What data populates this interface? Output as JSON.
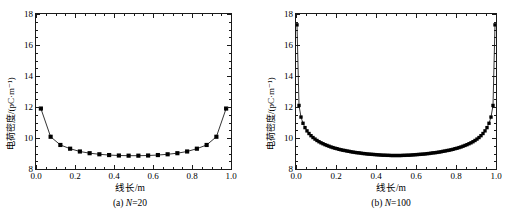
{
  "figure": {
    "panels": [
      {
        "id": "a",
        "caption_prefix": "(a) ",
        "caption_var": "N",
        "caption_suffix": "=20"
      },
      {
        "id": "b",
        "caption_prefix": "(b) ",
        "caption_var": "N",
        "caption_suffix": "=100"
      }
    ]
  },
  "chart_data": [
    {
      "type": "line",
      "title": "",
      "panel_label": "(a) N=20",
      "xlabel": "线长/m",
      "ylabel": "电荷密度/(pC·m⁻¹)",
      "xlim": [
        0.0,
        1.0
      ],
      "ylim": [
        8,
        18
      ],
      "xticks": [
        0.0,
        0.2,
        0.4,
        0.6,
        0.8,
        1.0
      ],
      "xticklabels": [
        "0.0",
        "0.2",
        "0.4",
        "0.6",
        "0.8",
        "1.0"
      ],
      "xminor_step": 0.05,
      "yticks": [
        8,
        10,
        12,
        14,
        16,
        18
      ],
      "yticklabels": [
        "8",
        "10",
        "12",
        "14",
        "16",
        "18"
      ],
      "yminor_step": 0.5,
      "grid": false,
      "legend": null,
      "marker": "square",
      "marker_color": "#000000",
      "line_color": "#000000",
      "series": [
        {
          "name": "N=20",
          "x": [
            0.025,
            0.075,
            0.125,
            0.175,
            0.225,
            0.275,
            0.325,
            0.375,
            0.425,
            0.475,
            0.525,
            0.575,
            0.625,
            0.675,
            0.725,
            0.775,
            0.825,
            0.875,
            0.925,
            0.975
          ],
          "y": [
            11.9,
            10.08,
            9.55,
            9.31,
            9.13,
            9.02,
            8.95,
            8.9,
            8.87,
            8.86,
            8.86,
            8.87,
            8.9,
            8.95,
            9.02,
            9.13,
            9.31,
            9.55,
            10.08,
            11.9
          ]
        }
      ]
    },
    {
      "type": "line",
      "title": "",
      "panel_label": "(b) N=100",
      "xlabel": "线长/m",
      "ylabel": "电荷密度/(pC·m⁻¹)",
      "xlim": [
        0.0,
        1.0
      ],
      "ylim": [
        8,
        18
      ],
      "xticks": [
        0.0,
        0.2,
        0.4,
        0.6,
        0.8,
        1.0
      ],
      "xticklabels": [
        "0.0",
        "0.2",
        "0.4",
        "0.6",
        "0.8",
        "1.0"
      ],
      "xminor_step": 0.05,
      "yticks": [
        8,
        10,
        12,
        14,
        16,
        18
      ],
      "yticklabels": [
        "8",
        "10",
        "12",
        "14",
        "16",
        "18"
      ],
      "yminor_step": 0.5,
      "grid": false,
      "legend": null,
      "marker": "square",
      "marker_color": "#000000",
      "line_color": "#000000",
      "series": [
        {
          "name": "N=100",
          "x": [
            0.005,
            0.015,
            0.025,
            0.035,
            0.045,
            0.055,
            0.065,
            0.075,
            0.085,
            0.095,
            0.105,
            0.115,
            0.125,
            0.135,
            0.145,
            0.155,
            0.165,
            0.175,
            0.185,
            0.195,
            0.205,
            0.215,
            0.225,
            0.235,
            0.245,
            0.255,
            0.265,
            0.275,
            0.285,
            0.295,
            0.305,
            0.315,
            0.325,
            0.335,
            0.345,
            0.355,
            0.365,
            0.375,
            0.385,
            0.395,
            0.405,
            0.415,
            0.425,
            0.435,
            0.445,
            0.455,
            0.465,
            0.475,
            0.485,
            0.495,
            0.505,
            0.515,
            0.525,
            0.535,
            0.545,
            0.555,
            0.565,
            0.575,
            0.585,
            0.595,
            0.605,
            0.615,
            0.625,
            0.635,
            0.645,
            0.655,
            0.665,
            0.675,
            0.685,
            0.695,
            0.705,
            0.715,
            0.725,
            0.735,
            0.745,
            0.755,
            0.765,
            0.775,
            0.785,
            0.795,
            0.805,
            0.815,
            0.825,
            0.835,
            0.845,
            0.855,
            0.865,
            0.875,
            0.885,
            0.895,
            0.905,
            0.915,
            0.925,
            0.935,
            0.945,
            0.955,
            0.965,
            0.975,
            0.985,
            0.995
          ],
          "y": [
            17.3,
            12.1,
            11.35,
            10.95,
            10.67,
            10.46,
            10.29,
            10.15,
            10.03,
            9.93,
            9.84,
            9.76,
            9.69,
            9.63,
            9.57,
            9.52,
            9.47,
            9.42,
            9.38,
            9.34,
            9.31,
            9.27,
            9.24,
            9.21,
            9.19,
            9.16,
            9.14,
            9.11,
            9.09,
            9.07,
            9.05,
            9.04,
            9.02,
            9.0,
            8.99,
            8.97,
            8.96,
            8.95,
            8.94,
            8.93,
            8.92,
            8.91,
            8.9,
            8.89,
            8.89,
            8.88,
            8.88,
            8.87,
            8.87,
            8.87,
            8.87,
            8.87,
            8.87,
            8.88,
            8.88,
            8.89,
            8.89,
            8.9,
            8.91,
            8.92,
            8.93,
            8.94,
            8.95,
            8.96,
            8.97,
            8.99,
            9.0,
            9.02,
            9.04,
            9.05,
            9.07,
            9.09,
            9.11,
            9.14,
            9.16,
            9.19,
            9.21,
            9.24,
            9.27,
            9.31,
            9.34,
            9.38,
            9.42,
            9.47,
            9.52,
            9.57,
            9.63,
            9.69,
            9.76,
            9.84,
            9.93,
            10.03,
            10.15,
            10.29,
            10.46,
            10.67,
            10.95,
            11.35,
            12.1,
            17.3
          ]
        }
      ]
    }
  ]
}
